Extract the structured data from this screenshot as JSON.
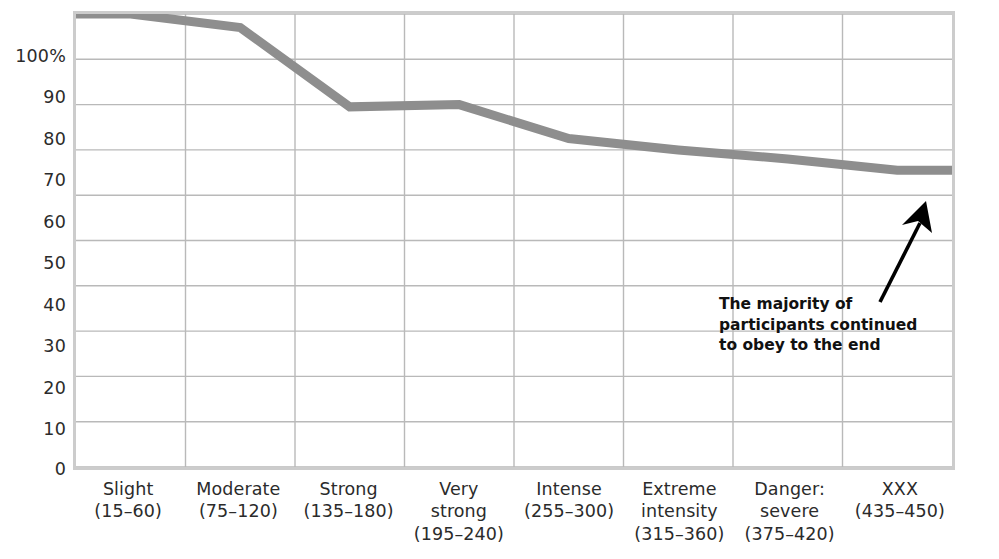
{
  "chart_data": {
    "type": "line",
    "title": "",
    "subtitle": "",
    "xlabel": "",
    "ylabel": "",
    "categories": [
      "Slight (15–60)",
      "Moderate (75–120)",
      "Strong (135–180)",
      "Very strong (195–240)",
      "Intense (255–300)",
      "Extreme intensity (315–360)",
      "Danger: severe (375–420)",
      "XXX (435–450)"
    ],
    "values": [
      100,
      97,
      79.5,
      80,
      72.5,
      70,
      68,
      65.5
    ],
    "ylim": [
      0,
      100
    ],
    "xlim": [
      0,
      8
    ],
    "grid": true,
    "legend": "none",
    "series": [
      {
        "name": "Percent of participants continuing to obey",
        "values": [
          100,
          97,
          79.5,
          80,
          72.5,
          70,
          68,
          65.5
        ],
        "color": "#8e8e8e"
      }
    ],
    "annotations": [
      {
        "text": "The majority of participants continued to obey to the end",
        "lines": [
          "The majority of",
          "participants continued",
          "to obey to the end"
        ],
        "points_to_category": "XXX (435–450)",
        "points_to_value": 65.5,
        "arrow_color": "#000000"
      }
    ]
  },
  "axes": {
    "y_ticks": [
      {
        "label": "100%",
        "value": 100
      },
      {
        "label": "90",
        "value": 90
      },
      {
        "label": "80",
        "value": 80
      },
      {
        "label": "70",
        "value": 70
      },
      {
        "label": "60",
        "value": 60
      },
      {
        "label": "50",
        "value": 50
      },
      {
        "label": "40",
        "value": 40
      },
      {
        "label": "30",
        "value": 30
      },
      {
        "label": "20",
        "value": 20
      },
      {
        "label": "10",
        "value": 10
      },
      {
        "label": "0",
        "value": 0
      }
    ],
    "x_ticks": [
      {
        "line1": "Slight",
        "line2": "(15–60)",
        "line3": ""
      },
      {
        "line1": "Moderate",
        "line2": "(75–120)",
        "line3": ""
      },
      {
        "line1": "Strong",
        "line2": "(135–180)",
        "line3": ""
      },
      {
        "line1": "Very",
        "line2": "strong",
        "line3": "(195–240)"
      },
      {
        "line1": "Intense",
        "line2": "(255–300)",
        "line3": ""
      },
      {
        "line1": "Extreme",
        "line2": "intensity",
        "line3": "(315–360)"
      },
      {
        "line1": "Danger:",
        "line2": "severe",
        "line3": "(375–420)"
      },
      {
        "line1": "XXX",
        "line2": "(435–450)",
        "line3": ""
      }
    ]
  },
  "annotation": {
    "line1": "The majority of",
    "line2": "participants continued",
    "line3": "to obey to the end"
  },
  "colors": {
    "line": "#8e8e8e",
    "grid": "#b9b9b9",
    "frame": "#cccccc",
    "text": "#2b2b2b",
    "arrow": "#000000",
    "background": "#ffffff"
  }
}
